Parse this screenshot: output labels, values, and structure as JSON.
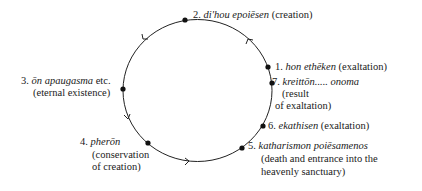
{
  "diagram": {
    "type": "cycle",
    "direction": "counterclockwise",
    "colors": {
      "stroke": "#222222",
      "text": "#1a1a1a",
      "background": "#ffffff"
    },
    "circle": {
      "cx": 197.5,
      "cy": 90.5,
      "rx": 74.5,
      "ry": 71
    },
    "nodes": [
      {
        "id": "1",
        "num": "1.",
        "term": "hon ethēken",
        "gloss": "(exaltation)",
        "dot": [
          268,
          67
        ]
      },
      {
        "id": "2",
        "num": "2.",
        "term": "di'hou epoiēsen",
        "gloss": "(creation)",
        "dot": [
          185,
          20
        ]
      },
      {
        "id": "3",
        "num": "3.",
        "term": "ōn apaugasma",
        "suffix": "etc.",
        "gloss": "(eternal existence)",
        "dot": [
          123,
          89
        ]
      },
      {
        "id": "4",
        "num": "4.",
        "term": "pherōn",
        "gloss_lines": [
          "(conservation",
          "of creation)"
        ],
        "dot": [
          148,
          143
        ]
      },
      {
        "id": "5",
        "num": "5.",
        "term": "katharismon poiēsamenos",
        "gloss_lines": [
          "(death and entrance into the",
          "heavenly sanctuary)"
        ],
        "dot": [
          242,
          148
        ]
      },
      {
        "id": "6",
        "num": "6.",
        "term": "ekathisen",
        "gloss": "(exaltation)",
        "dot": [
          263,
          126
        ]
      },
      {
        "id": "7",
        "num": "7.",
        "term": "kreittōn..... onoma",
        "gloss_lines": [
          "(result",
          "of exaltation)"
        ],
        "dot": [
          272,
          83
        ]
      }
    ],
    "arrows": [
      {
        "at": [
          248,
          39
        ],
        "direction": "up-left"
      },
      {
        "at": [
          143,
          39
        ],
        "direction": "down-left"
      },
      {
        "at": [
          128,
          118
        ],
        "direction": "down"
      },
      {
        "at": [
          188,
          162
        ],
        "direction": "right"
      }
    ]
  }
}
